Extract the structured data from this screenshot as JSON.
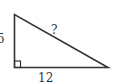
{
  "diagram": {
    "type": "right-triangle",
    "labels": {
      "vertical_leg": "5",
      "hypotenuse": "?",
      "horizontal_leg": "12"
    },
    "right_angle_marker": true,
    "colors": {
      "stroke": "#333333",
      "background": "#ffffff"
    }
  }
}
